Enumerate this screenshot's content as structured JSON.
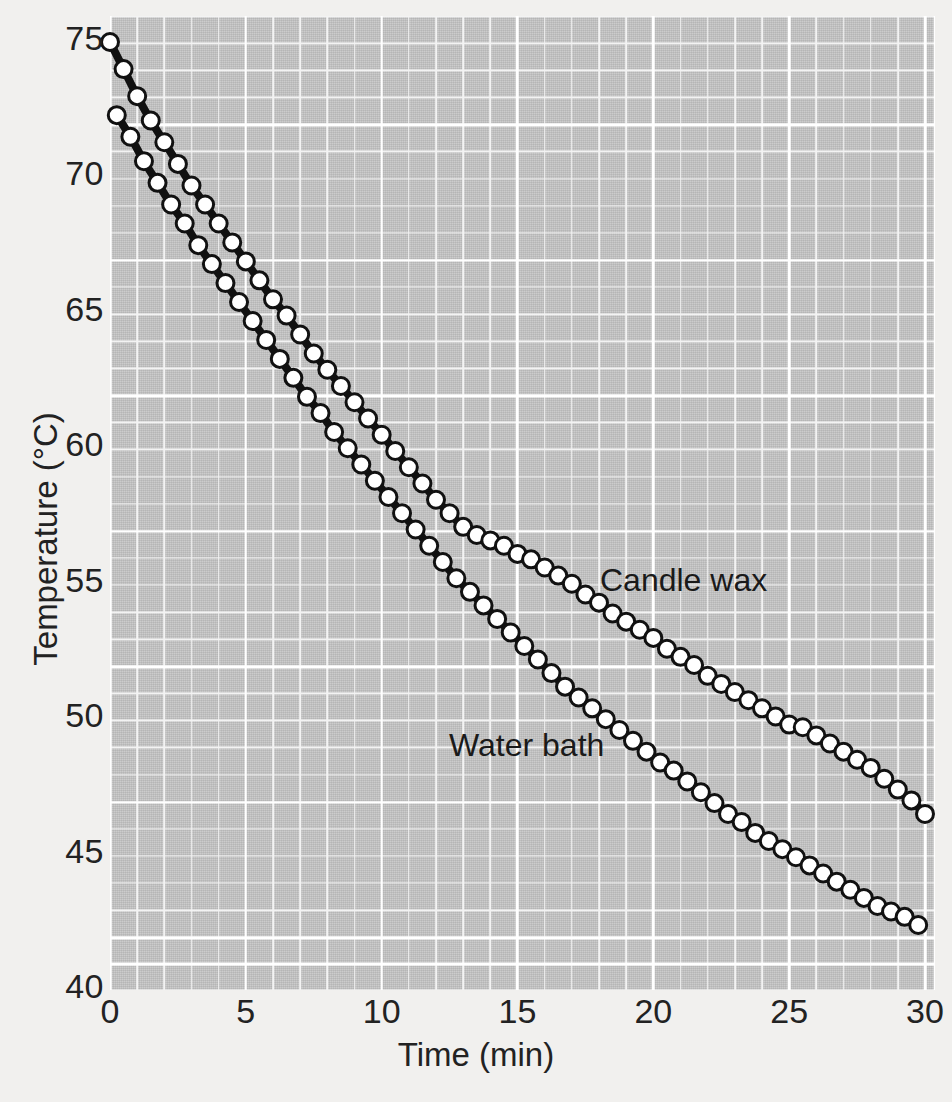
{
  "figure": {
    "background_color": "#f1f0ee",
    "plot_background_color": "#c6c6c6",
    "grid_color": "#ffffff",
    "line_color": "#111111",
    "marker_fill": "#ffffff"
  },
  "axis": {
    "x_title": "Time (min)",
    "y_title": "Temperature (°C)",
    "x_ticks": [
      "0",
      "5",
      "10",
      "15",
      "20",
      "25",
      "30"
    ],
    "y_ticks": [
      "75",
      "70",
      "65",
      "60",
      "55",
      "50",
      "45",
      "40"
    ]
  },
  "labels": {
    "candle_wax": "Candle wax",
    "water_bath": "Water bath"
  },
  "chart_data": {
    "type": "line",
    "title": "",
    "xlabel": "Time (min)",
    "ylabel": "Temperature (°C)",
    "xlim": [
      0,
      30
    ],
    "ylim": [
      40,
      76
    ],
    "x_ticks": [
      0,
      5,
      10,
      15,
      20,
      25,
      30
    ],
    "y_ticks": [
      40,
      45,
      50,
      55,
      60,
      65,
      70,
      75
    ],
    "grid": true,
    "legend_position": "inline-annotation",
    "series": [
      {
        "name": "Candle wax",
        "marker": "open-circle",
        "x": [
          0,
          0.5,
          1,
          1.5,
          2,
          2.5,
          3,
          3.5,
          4,
          4.5,
          5,
          5.5,
          6,
          6.5,
          7,
          7.5,
          8,
          8.5,
          9,
          9.5,
          10,
          10.5,
          11,
          11.5,
          12,
          12.5,
          13,
          13.5,
          14,
          14.5,
          15,
          15.5,
          16,
          16.5,
          17,
          17.5,
          18,
          18.5,
          19,
          19.5,
          20,
          20.5,
          21,
          21.5,
          22,
          22.5,
          23,
          23.5,
          24,
          24.5,
          25,
          25.5,
          26,
          26.5,
          27,
          27.5,
          28,
          28.5,
          29,
          29.5,
          30
        ],
        "y": [
          75.0,
          74.0,
          73.0,
          72.1,
          71.3,
          70.5,
          69.7,
          69.0,
          68.3,
          67.6,
          66.9,
          66.2,
          65.5,
          64.9,
          64.2,
          63.5,
          62.9,
          62.3,
          61.7,
          61.1,
          60.5,
          59.9,
          59.3,
          58.7,
          58.1,
          57.6,
          57.1,
          56.8,
          56.6,
          56.4,
          56.1,
          55.9,
          55.6,
          55.3,
          55.0,
          54.6,
          54.3,
          53.9,
          53.6,
          53.3,
          53.0,
          52.6,
          52.3,
          52.0,
          51.6,
          51.3,
          51.0,
          50.7,
          50.4,
          50.1,
          49.8,
          49.7,
          49.4,
          49.1,
          48.8,
          48.5,
          48.2,
          47.8,
          47.4,
          47.0,
          46.5
        ]
      },
      {
        "name": "Water bath",
        "marker": "open-circle",
        "x": [
          0.25,
          0.75,
          1.25,
          1.75,
          2.25,
          2.75,
          3.25,
          3.75,
          4.25,
          4.75,
          5.25,
          5.75,
          6.25,
          6.75,
          7.25,
          7.75,
          8.25,
          8.75,
          9.25,
          9.75,
          10.25,
          10.75,
          11.25,
          11.75,
          12.25,
          12.75,
          13.25,
          13.75,
          14.25,
          14.75,
          15.25,
          15.75,
          16.25,
          16.75,
          17.25,
          17.75,
          18.25,
          18.75,
          19.25,
          19.75,
          20.25,
          20.75,
          21.25,
          21.75,
          22.25,
          22.75,
          23.25,
          23.75,
          24.25,
          24.75,
          25.25,
          25.75,
          26.25,
          26.75,
          27.25,
          27.75,
          28.25,
          28.75,
          29.25,
          29.75
        ],
        "y": [
          72.3,
          71.5,
          70.6,
          69.8,
          69.0,
          68.3,
          67.5,
          66.8,
          66.1,
          65.4,
          64.7,
          64.0,
          63.3,
          62.6,
          61.9,
          61.3,
          60.6,
          60.0,
          59.4,
          58.8,
          58.2,
          57.6,
          57.0,
          56.4,
          55.8,
          55.2,
          54.7,
          54.2,
          53.7,
          53.2,
          52.7,
          52.2,
          51.7,
          51.2,
          50.8,
          50.4,
          50.0,
          49.6,
          49.2,
          48.8,
          48.4,
          48.1,
          47.7,
          47.3,
          46.9,
          46.5,
          46.2,
          45.8,
          45.5,
          45.2,
          44.9,
          44.6,
          44.3,
          44.0,
          43.7,
          43.4,
          43.1,
          42.9,
          42.7,
          42.4
        ]
      }
    ]
  }
}
